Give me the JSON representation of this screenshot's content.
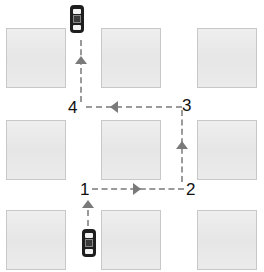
{
  "diagram": {
    "blocks": [
      {
        "row": 1,
        "col": 1
      },
      {
        "row": 1,
        "col": 2
      },
      {
        "row": 1,
        "col": 3
      },
      {
        "row": 2,
        "col": 1
      },
      {
        "row": 2,
        "col": 2
      },
      {
        "row": 2,
        "col": 3
      },
      {
        "row": 3,
        "col": 1
      },
      {
        "row": 3,
        "col": 2
      },
      {
        "row": 3,
        "col": 3
      }
    ],
    "waypoints": [
      {
        "id": "1",
        "label": "1"
      },
      {
        "id": "2",
        "label": "2"
      },
      {
        "id": "3",
        "label": "3"
      },
      {
        "id": "4",
        "label": "4"
      }
    ],
    "route": [
      "start (bottom car)",
      "1",
      "2",
      "3",
      "4",
      "end (top car)"
    ],
    "arrows": [
      {
        "segment": "start-1",
        "direction": "up"
      },
      {
        "segment": "1-2",
        "direction": "right"
      },
      {
        "segment": "2-3",
        "direction": "up"
      },
      {
        "segment": "3-4",
        "direction": "left"
      },
      {
        "segment": "4-end",
        "direction": "up"
      }
    ],
    "cars": [
      {
        "position": "start",
        "icon": "car-icon"
      },
      {
        "position": "end",
        "icon": "car-icon"
      }
    ],
    "colors": {
      "block_fill": "#ebebeb",
      "block_border": "#c8c8c8",
      "route_dash": "#9a9a9a",
      "arrow": "#7a7a7a",
      "car": "#1e1e1e",
      "label": "#111111"
    }
  }
}
